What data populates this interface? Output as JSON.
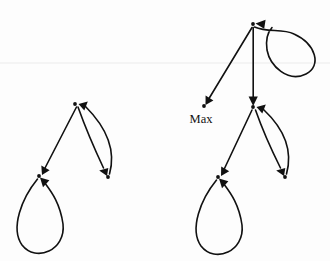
{
  "figure": {
    "name": "state-transition-graphs",
    "background_color": "#fdfdfd",
    "stroke_color": "#111111",
    "width": 330,
    "height": 261,
    "labels": [
      {
        "id": "max-label",
        "text": "Max",
        "x": 201,
        "y": 123
      }
    ],
    "graphs": [
      {
        "id": "left-graph",
        "name": "left-transition-graph",
        "nodes": [
          {
            "id": "L-top",
            "name": "node-top",
            "x": 75,
            "y": 104,
            "label": ""
          },
          {
            "id": "L-left",
            "name": "node-lower-left",
            "x": 39,
            "y": 176,
            "label": ""
          },
          {
            "id": "L-right",
            "name": "node-lower-right",
            "x": 108,
            "y": 177,
            "label": ""
          }
        ],
        "edges": [
          {
            "id": "L-e1",
            "name": "edge-top-to-lower-left",
            "from": "L-top",
            "to": "L-left",
            "kind": "straight"
          },
          {
            "id": "L-e2",
            "name": "edge-top-to-lower-right",
            "from": "L-top",
            "to": "L-right",
            "kind": "curve-left"
          },
          {
            "id": "L-e3",
            "name": "edge-lower-right-to-top",
            "from": "L-right",
            "to": "L-top",
            "kind": "curve-right"
          },
          {
            "id": "L-e4",
            "name": "self-loop-lower-left",
            "from": "L-left",
            "to": "L-left",
            "kind": "self-loop-down"
          }
        ]
      },
      {
        "id": "right-graph",
        "name": "right-transition-graph",
        "nodes": [
          {
            "id": "R-top",
            "name": "node-top",
            "x": 253,
            "y": 24,
            "label": ""
          },
          {
            "id": "R-max",
            "name": "node-max",
            "x": 204,
            "y": 106,
            "label": "Max"
          },
          {
            "id": "R-mid",
            "name": "node-middle",
            "x": 253,
            "y": 107,
            "label": ""
          },
          {
            "id": "R-left",
            "name": "node-lower-left",
            "x": 218,
            "y": 177,
            "label": ""
          },
          {
            "id": "R-right",
            "name": "node-lower-right",
            "x": 285,
            "y": 177,
            "label": ""
          }
        ],
        "edges": [
          {
            "id": "R-e0",
            "name": "self-loop-top",
            "from": "R-top",
            "to": "R-top",
            "kind": "self-loop-right"
          },
          {
            "id": "R-e1",
            "name": "edge-top-to-max",
            "from": "R-top",
            "to": "R-max",
            "kind": "straight"
          },
          {
            "id": "R-e2",
            "name": "edge-top-to-middle",
            "from": "R-top",
            "to": "R-mid",
            "kind": "straight"
          },
          {
            "id": "R-e3",
            "name": "edge-middle-to-lower-left",
            "from": "R-mid",
            "to": "R-left",
            "kind": "straight"
          },
          {
            "id": "R-e4",
            "name": "edge-middle-to-lower-right",
            "from": "R-mid",
            "to": "R-right",
            "kind": "curve-left"
          },
          {
            "id": "R-e5",
            "name": "edge-lower-right-to-middle",
            "from": "R-right",
            "to": "R-mid",
            "kind": "curve-right"
          },
          {
            "id": "R-e6",
            "name": "self-loop-lower-left",
            "from": "R-left",
            "to": "R-left",
            "kind": "self-loop-down"
          }
        ]
      }
    ]
  }
}
